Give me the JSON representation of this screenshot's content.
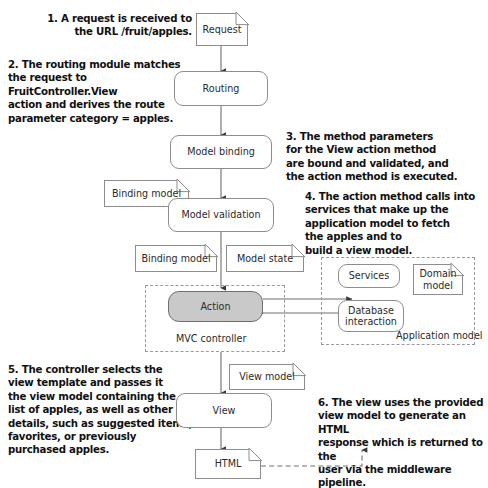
{
  "diagram": {
    "notes": [
      {
        "id": "note-1",
        "text": "1. A request is received to\nthe URL /fruit/apples."
      },
      {
        "id": "note-2",
        "text": "2. The routing module matches\nthe request to FruitController.View\naction and derives the route\nparameter category = apples."
      },
      {
        "id": "note-3",
        "text": "3. The method parameters\nfor the View action method\nare bound and validated, and\nthe action method is executed."
      },
      {
        "id": "note-4",
        "text": "4. The action method calls into\nservices that make up the\napplication model to fetch\nthe apples and to\nbuild a view model."
      },
      {
        "id": "note-5",
        "text": "5. The controller selects the\nview template and passes it\nthe view model containing the\nlist of apples, as well as other\ndetails, such as suggested items,\nfavorites, or previously\npurchased apples."
      },
      {
        "id": "note-6",
        "text": "6. The view uses the provided\nview model to generate an HTML\nresponse which is returned to the\nuser via the middleware pipeline."
      }
    ],
    "nodes": {
      "request": "Request",
      "routing": "Routing",
      "model_binding": "Model binding",
      "binding_model_1": "Binding model",
      "model_validation": "Model validation",
      "binding_model_2": "Binding model",
      "model_state": "Model state",
      "action": "Action",
      "services": "Services",
      "domain_model": "Domain\nmodel",
      "database_interaction": "Database\ninteraction",
      "view_model": "View model",
      "view": "View",
      "html": "HTML"
    },
    "groups": {
      "mvc_controller": "MVC controller",
      "application_model": "Application model"
    },
    "colors": {
      "action_fill": "#c9c9c9",
      "stroke": "#8d8d8d",
      "dashed_stroke": "#9a9a9a",
      "text": "#2b2b2b",
      "note_text": "#111111",
      "background": "#ffffff"
    }
  }
}
